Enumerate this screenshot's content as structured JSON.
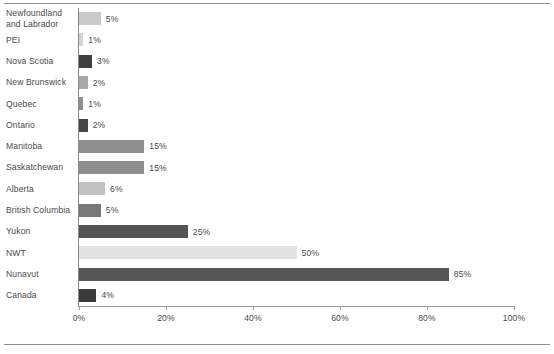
{
  "chart_data": {
    "type": "bar",
    "orientation": "horizontal",
    "title": "",
    "subtitle": "",
    "xlabel": "",
    "ylabel": "",
    "xlim": [
      0,
      100
    ],
    "grid": false,
    "legend": null,
    "tick_labels": [
      "0%",
      "20%",
      "40%",
      "60%",
      "80%",
      "100%"
    ],
    "tick_values": [
      0,
      20,
      40,
      60,
      80,
      100
    ],
    "value_suffix": "%",
    "categories": [
      "Newfoundland\nand Labrador",
      "PEI",
      "Nova Scotia",
      "New Brunswick",
      "Quebec",
      "Ontario",
      "Manitoba",
      "Saskatchewan",
      "Alberta",
      "British Columbia",
      "Yukon",
      "NWT",
      "Nunavut",
      "Canada"
    ],
    "values": [
      5,
      1,
      3,
      2,
      1,
      2,
      15,
      15,
      6,
      5,
      25,
      50,
      85,
      4
    ],
    "value_labels": [
      "5%",
      "1%",
      "3%",
      "2%",
      "1%",
      "2%",
      "15%",
      "15%",
      "6%",
      "5%",
      "25%",
      "50%",
      "85%",
      "4%"
    ],
    "bar_colors": [
      "#c9c9c9",
      "#d4d4d4",
      "#3f3f3f",
      "#a9a9a9",
      "#8f8f8f",
      "#474747",
      "#8f8f8f",
      "#8f8f8f",
      "#c2c2c2",
      "#787878",
      "#545454",
      "#e2e2e2",
      "#565656",
      "#3a3a3a"
    ]
  },
  "colors": {
    "axis": "#9a9a9a",
    "rule": "#8f8f8f",
    "text": "#4a4a4a",
    "background": "#ffffff"
  }
}
